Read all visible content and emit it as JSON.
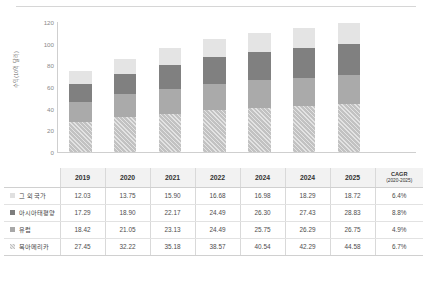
{
  "chart_data": {
    "type": "bar",
    "stacked": true,
    "title": "",
    "xlabel": "",
    "ylabel": "수익(10억 달러)",
    "ylim": [
      0,
      120
    ],
    "yticks": [
      0,
      20,
      40,
      60,
      80,
      100,
      120
    ],
    "grid": false,
    "legend_position": "table-left-column",
    "categories": [
      "2019",
      "2020",
      "2021",
      "2022",
      "2024",
      "2024",
      "2025"
    ],
    "series": [
      {
        "name": "북아메리카",
        "values": [
          27.45,
          32.22,
          35.18,
          38.57,
          40.54,
          42.29,
          44.58
        ],
        "cagr": "6.7%",
        "color": "#c2c2c2",
        "pattern": "diagonal-hatch",
        "stack_order": 1
      },
      {
        "name": "유럽",
        "values": [
          18.42,
          21.05,
          23.13,
          24.49,
          25.75,
          26.29,
          26.75
        ],
        "cagr": "4.9%",
        "color": "#aaaaaa",
        "pattern": "solid",
        "stack_order": 2
      },
      {
        "name": "아시아태평양",
        "values": [
          17.29,
          18.9,
          22.17,
          24.49,
          26.3,
          27.43,
          28.83
        ],
        "cagr": "8.8%",
        "color": "#808080",
        "pattern": "solid",
        "stack_order": 3
      },
      {
        "name": "그 외 국가",
        "values": [
          12.03,
          13.75,
          15.9,
          16.68,
          16.98,
          18.29,
          18.72
        ],
        "cagr": "6.4%",
        "color": "#e4e4e4",
        "pattern": "solid",
        "stack_order": 4
      }
    ]
  },
  "table": {
    "corner_label": "",
    "columns": [
      "2019",
      "2020",
      "2021",
      "2022",
      "2024",
      "2024",
      "2025"
    ],
    "cagr_header": "CAGR",
    "cagr_subheader": "(2020-2025)",
    "rows": [
      {
        "label": "그 외 국가",
        "swatch": "sw-others",
        "values": [
          "12.03",
          "13.75",
          "15.90",
          "16.68",
          "16.98",
          "18.29",
          "18.72"
        ],
        "cagr": "6.4%"
      },
      {
        "label": "아시아태평양",
        "swatch": "sw-apac",
        "values": [
          "17.29",
          "18.90",
          "22.17",
          "24.49",
          "26.30",
          "27.43",
          "28.83"
        ],
        "cagr": "8.8%"
      },
      {
        "label": "유럽",
        "swatch": "sw-eu",
        "values": [
          "18.42",
          "21.05",
          "23.13",
          "24.49",
          "25.75",
          "26.29",
          "26.75"
        ],
        "cagr": "4.9%"
      },
      {
        "label": "북아메리카",
        "swatch": "sw-na",
        "values": [
          "27.45",
          "32.22",
          "35.18",
          "38.57",
          "40.54",
          "42.29",
          "44.58"
        ],
        "cagr": "6.7%"
      }
    ]
  }
}
